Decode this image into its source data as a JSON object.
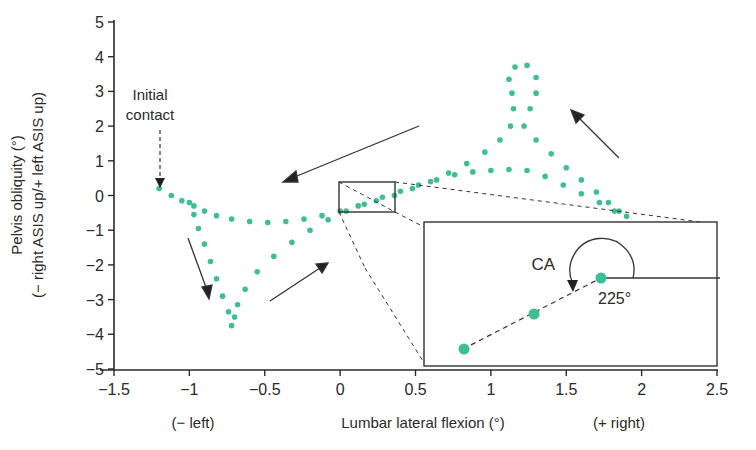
{
  "chart_data": {
    "type": "scatter",
    "title": "",
    "xlabel": "Lumbar lateral flexion (°)",
    "xlabel_left": "(− left)",
    "xlabel_right": "(+ right)",
    "ylabel_line1": "Pelvis obliquity (°)",
    "ylabel_line2": "(− right ASIS up/+ left ASIS up)",
    "xlim": [
      -1.5,
      2.5
    ],
    "ylim": [
      -5,
      5
    ],
    "x_ticks": [
      -1.5,
      -1,
      -0.5,
      0,
      0.5,
      1,
      1.5,
      2,
      2.5
    ],
    "x_tick_labels": [
      "−1.5",
      "−1",
      "−0.5",
      "0",
      "0.5",
      "1",
      "1.5",
      "2",
      "2.5"
    ],
    "y_ticks": [
      5,
      4,
      3,
      2,
      1,
      0,
      -1,
      -2,
      -3,
      -4,
      -5
    ],
    "y_tick_labels": [
      "5",
      "4",
      "3",
      "2",
      "1",
      "0",
      "−1",
      "−2",
      "−3",
      "−4",
      "−5"
    ],
    "grid": false,
    "series": [
      {
        "name": "pelvis-lumbar coupling trajectory",
        "color": "#3dbf91",
        "marker": "dot",
        "points": [
          [
            -1.2,
            0.2
          ],
          [
            -1.12,
            0.0
          ],
          [
            -1.05,
            -0.15
          ],
          [
            -0.97,
            -0.3
          ],
          [
            -0.9,
            -0.45
          ],
          [
            -0.82,
            -0.58
          ],
          [
            -0.72,
            -0.68
          ],
          [
            -0.6,
            -0.75
          ],
          [
            -0.48,
            -0.78
          ],
          [
            -0.36,
            -0.75
          ],
          [
            -0.24,
            -0.68
          ],
          [
            -0.12,
            -0.58
          ],
          [
            0.0,
            -0.45
          ],
          [
            0.12,
            -0.3
          ],
          [
            0.24,
            -0.15
          ],
          [
            0.36,
            0.0
          ],
          [
            0.48,
            0.2
          ],
          [
            0.6,
            0.4
          ],
          [
            0.72,
            0.65
          ],
          [
            0.84,
            0.92
          ],
          [
            0.96,
            1.25
          ],
          [
            1.06,
            1.6
          ],
          [
            1.13,
            2.0
          ],
          [
            1.15,
            2.5
          ],
          [
            1.14,
            2.95
          ],
          [
            1.12,
            3.35
          ],
          [
            1.16,
            3.7
          ],
          [
            1.24,
            3.75
          ],
          [
            1.3,
            3.4
          ],
          [
            1.3,
            2.95
          ],
          [
            1.26,
            2.5
          ],
          [
            1.22,
            2.0
          ],
          [
            1.3,
            1.6
          ],
          [
            1.4,
            1.2
          ],
          [
            1.5,
            0.8
          ],
          [
            1.6,
            0.45
          ],
          [
            1.7,
            0.1
          ],
          [
            1.78,
            -0.2
          ],
          [
            1.85,
            -0.45
          ],
          [
            1.9,
            -0.6
          ],
          [
            1.82,
            -0.45
          ],
          [
            1.72,
            -0.2
          ],
          [
            1.6,
            0.05
          ],
          [
            1.48,
            0.3
          ],
          [
            1.36,
            0.55
          ],
          [
            1.24,
            0.72
          ],
          [
            1.12,
            0.75
          ],
          [
            1.0,
            0.72
          ],
          [
            0.88,
            0.68
          ],
          [
            0.76,
            0.6
          ],
          [
            0.64,
            0.45
          ],
          [
            0.52,
            0.3
          ],
          [
            0.4,
            0.12
          ],
          [
            0.28,
            -0.05
          ],
          [
            0.16,
            -0.25
          ],
          [
            0.04,
            -0.45
          ],
          [
            -0.08,
            -0.7
          ],
          [
            -0.2,
            -1.0
          ],
          [
            -0.32,
            -1.35
          ],
          [
            -0.44,
            -1.75
          ],
          [
            -0.55,
            -2.2
          ],
          [
            -0.63,
            -2.7
          ],
          [
            -0.68,
            -3.15
          ],
          [
            -0.7,
            -3.5
          ],
          [
            -0.72,
            -3.75
          ],
          [
            -0.74,
            -3.35
          ],
          [
            -0.78,
            -2.9
          ],
          [
            -0.82,
            -2.4
          ],
          [
            -0.86,
            -1.9
          ],
          [
            -0.9,
            -1.4
          ],
          [
            -0.94,
            -0.95
          ],
          [
            -0.97,
            -0.55
          ],
          [
            -1.0,
            -0.2
          ]
        ]
      }
    ],
    "annotations": [
      {
        "text": "Initial contact",
        "x": -1.2,
        "y": 0.2,
        "style": "dashed arrow"
      },
      {
        "text": "direction arrow",
        "from": [
          0.35,
          1.3
        ],
        "to": [
          -0.55,
          0.25
        ]
      },
      {
        "text": "direction arrow",
        "from": [
          -1.0,
          -1.8
        ],
        "to": [
          -0.9,
          -3.0
        ]
      },
      {
        "text": "direction arrow",
        "from": [
          -0.7,
          -3.1
        ],
        "to": [
          -0.2,
          -2.3
        ]
      },
      {
        "text": "direction arrow",
        "from": [
          1.9,
          0.9
        ],
        "to": [
          1.55,
          2.65
        ]
      }
    ],
    "inset": {
      "source_box": {
        "x0": -0.02,
        "x1": 0.3,
        "y0": -0.3,
        "y1": 0.4
      },
      "label": "CA",
      "angle_label": "225°",
      "angle_deg": 225,
      "points": [
        [
          0.75,
          -4.45
        ],
        [
          1.2,
          -3.4
        ],
        [
          1.65,
          -2.35
        ]
      ]
    }
  }
}
